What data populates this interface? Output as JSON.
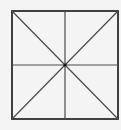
{
  "diagram": {
    "type": "square-with-diagonals-and-midlines",
    "background": "#f4f4f4",
    "square": {
      "x": 12,
      "y": 11,
      "width": 106,
      "height": 108,
      "stroke": "#2e2e2e",
      "stroke_width": 1.8
    },
    "center": {
      "x": 65,
      "y": 65,
      "radius": 1.6,
      "fill": "#111111"
    },
    "lines": [
      {
        "name": "diagonal-top-left-to-bottom-right",
        "x1": 12,
        "y1": 11,
        "x2": 118,
        "y2": 119
      },
      {
        "name": "diagonal-top-right-to-bottom-left",
        "x1": 118,
        "y1": 11,
        "x2": 12,
        "y2": 119
      },
      {
        "name": "vertical-midline",
        "x1": 65,
        "y1": 11,
        "x2": 65,
        "y2": 119
      },
      {
        "name": "horizontal-midline",
        "x1": 12,
        "y1": 65,
        "x2": 118,
        "y2": 65
      }
    ],
    "line_stroke": "#4a4a4a",
    "line_stroke_width": 1.2
  }
}
